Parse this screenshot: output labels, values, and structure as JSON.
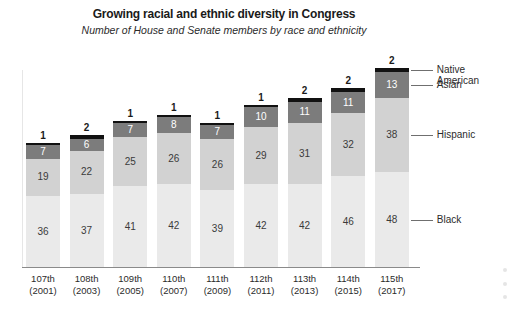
{
  "chart_data": {
    "type": "bar",
    "subtype": "stacked-bar",
    "title": "Growing racial and ethnic diversity in Congress",
    "subtitle": "Number of House and Senate members by race and ethnicity",
    "xlabel": "",
    "ylabel": "",
    "grid": false,
    "legend_position": "right-inline-labels",
    "ylim": [
      0,
      101
    ],
    "categories": [
      "107th\n(2001)",
      "108th\n(2003)",
      "109th\n(2005)",
      "110th\n(2007)",
      "111th\n(2009)",
      "112th\n(2011)",
      "113th\n(2013)",
      "114th\n(2015)",
      "115th\n(2017)"
    ],
    "category_lines": [
      [
        "107th",
        "(2001)"
      ],
      [
        "108th",
        "(2003)"
      ],
      [
        "109th",
        "(2005)"
      ],
      [
        "110th",
        "(2007)"
      ],
      [
        "111th",
        "(2009)"
      ],
      [
        "112th",
        "(2011)"
      ],
      [
        "113th",
        "(2013)"
      ],
      [
        "114th",
        "(2015)"
      ],
      [
        "115th",
        "(2017)"
      ]
    ],
    "series": [
      {
        "name": "Black",
        "color": "#eaeaea",
        "values": [
          36,
          37,
          41,
          42,
          39,
          42,
          42,
          46,
          48
        ]
      },
      {
        "name": "Hispanic",
        "color": "#d2d2d2",
        "values": [
          19,
          22,
          25,
          26,
          26,
          29,
          31,
          32,
          38
        ]
      },
      {
        "name": "Asian",
        "color": "#7c7c7c",
        "values": [
          7,
          6,
          7,
          8,
          7,
          10,
          11,
          11,
          13
        ]
      },
      {
        "name": "Native American",
        "color": "#111111",
        "values": [
          1,
          2,
          1,
          1,
          1,
          1,
          2,
          2,
          2
        ]
      }
    ],
    "totals": [
      63,
      67,
      74,
      77,
      73,
      82,
      86,
      91,
      101
    ],
    "annotations": {
      "top_labels": [
        "1",
        "2",
        "1",
        "1",
        "1",
        "1",
        "2",
        "2",
        "2"
      ],
      "note": "Top bold number above each bar is the Native American count"
    }
  },
  "category_labels": {
    "native_american_line1": "Native",
    "native_american_line2": "American",
    "asian": "Asian",
    "hispanic": "Hispanic",
    "black": "Black"
  }
}
